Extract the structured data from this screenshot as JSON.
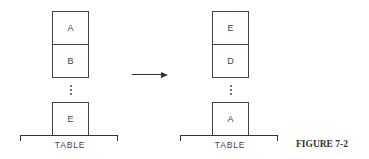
{
  "figure": {
    "caption": "FIGURE 7-2"
  },
  "left_stack": {
    "blocks": [
      "A",
      "B",
      "E"
    ],
    "table_label": "TABLE"
  },
  "right_stack": {
    "blocks": [
      "E",
      "D",
      "A"
    ],
    "table_label": "TABLE"
  },
  "arrow": {
    "direction": "right"
  }
}
